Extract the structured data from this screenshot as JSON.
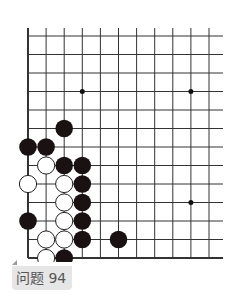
{
  "problem": {
    "label": "问题 94"
  },
  "board": {
    "origin_x": 28,
    "origin_y": 36,
    "step_x": 18.1,
    "step_y": 18.5,
    "cols": 11,
    "rows": 13,
    "line_extend_right": 223,
    "line_color": "#333333",
    "star_points": [
      [
        3,
        3
      ],
      [
        9,
        3
      ],
      [
        9,
        9
      ]
    ],
    "black_stones": [
      [
        2,
        5
      ],
      [
        0,
        6
      ],
      [
        1,
        6
      ],
      [
        2,
        7
      ],
      [
        3,
        7
      ],
      [
        3,
        8
      ],
      [
        3,
        9
      ],
      [
        3,
        10
      ],
      [
        3,
        11
      ],
      [
        0,
        10
      ],
      [
        5,
        11
      ],
      [
        2,
        12
      ]
    ],
    "white_stones": [
      [
        1,
        7
      ],
      [
        0,
        8
      ],
      [
        2,
        8
      ],
      [
        2,
        9
      ],
      [
        2,
        10
      ],
      [
        1,
        11
      ],
      [
        2,
        11
      ],
      [
        1,
        12
      ]
    ]
  }
}
